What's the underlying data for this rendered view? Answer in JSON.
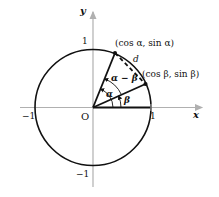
{
  "diagram": {
    "axes": {
      "x_label": "x",
      "y_label": "y",
      "origin_label": "O",
      "ticks": {
        "x_pos": "1",
        "x_neg": "−1",
        "y_pos": "1",
        "y_neg": "−1"
      }
    },
    "points": {
      "alpha": "(cos α, sin α)",
      "beta": "(cos β, sin β)"
    },
    "angles": {
      "alpha": "α",
      "beta": "β",
      "difference": "α − β"
    },
    "chord_label": "d",
    "colors": {
      "circle": "#111111",
      "axes": "#b0b0b0",
      "text": "#111111"
    }
  }
}
